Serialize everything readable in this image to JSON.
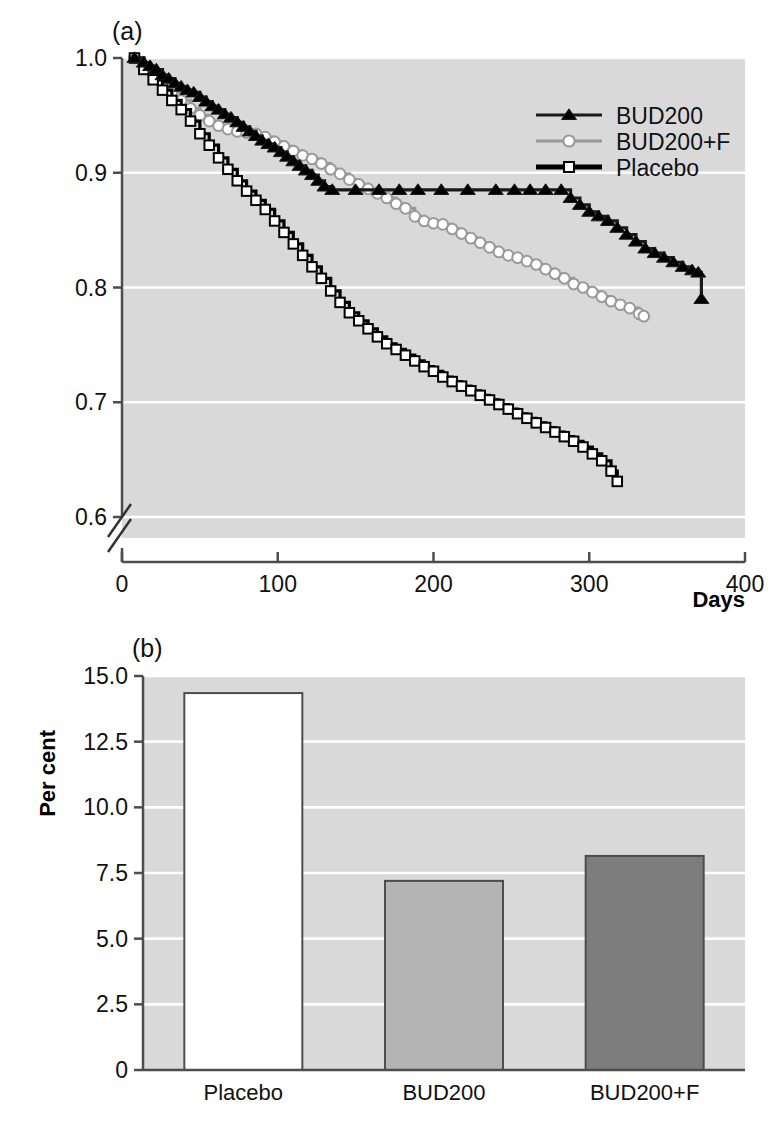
{
  "figure": {
    "panel_a_label": "(a)",
    "panel_b_label": "(b)"
  },
  "chart_data": [
    {
      "type": "line",
      "panel": "(a)",
      "title": "",
      "xlabel": "Days",
      "ylabel": "",
      "xlim": [
        0,
        400
      ],
      "ylim": [
        0.6,
        1.0
      ],
      "xticks": [
        0,
        100,
        200,
        300,
        400
      ],
      "xtick_labels": [
        "0",
        "100",
        "200",
        "300",
        "400"
      ],
      "yticks": [
        0.6,
        0.7,
        0.8,
        0.9,
        1.0
      ],
      "ytick_labels": [
        "0.6",
        "0.7",
        "0.8",
        "0.9",
        "1.0"
      ],
      "grid": true,
      "grid_color": "#ffffff",
      "plot_background": "#d9d9d9",
      "y_axis_break": true,
      "legend_position": "top-right",
      "series": [
        {
          "name": "BUD200",
          "color": "#1a1a1a",
          "marker": "triangle",
          "marker_color": "#000000",
          "x": [
            8,
            14,
            18,
            22,
            26,
            30,
            34,
            38,
            42,
            46,
            50,
            54,
            58,
            62,
            66,
            70,
            74,
            78,
            82,
            86,
            90,
            94,
            98,
            102,
            106,
            110,
            114,
            118,
            122,
            126,
            130,
            135,
            150,
            165,
            178,
            190,
            205,
            222,
            240,
            252,
            262,
            272,
            282,
            288,
            294,
            300,
            306,
            312,
            318,
            324,
            330,
            336,
            342,
            348,
            354,
            360,
            366,
            370,
            372
          ],
          "y": [
            1.0,
            0.996,
            0.993,
            0.99,
            0.985,
            0.982,
            0.978,
            0.975,
            0.972,
            0.97,
            0.966,
            0.962,
            0.958,
            0.955,
            0.951,
            0.948,
            0.944,
            0.94,
            0.936,
            0.932,
            0.928,
            0.925,
            0.922,
            0.918,
            0.914,
            0.91,
            0.906,
            0.902,
            0.898,
            0.893,
            0.888,
            0.885,
            0.885,
            0.885,
            0.885,
            0.885,
            0.885,
            0.885,
            0.885,
            0.885,
            0.885,
            0.885,
            0.885,
            0.878,
            0.872,
            0.866,
            0.862,
            0.858,
            0.852,
            0.846,
            0.84,
            0.834,
            0.83,
            0.826,
            0.822,
            0.818,
            0.815,
            0.813,
            0.79
          ]
        },
        {
          "name": "BUD200+F",
          "color": "#9a9a9a",
          "marker": "circle",
          "marker_color": "#ffffff",
          "x": [
            8,
            14,
            20,
            26,
            32,
            38,
            44,
            50,
            56,
            62,
            68,
            74,
            80,
            86,
            92,
            98,
            104,
            110,
            116,
            122,
            128,
            134,
            140,
            146,
            152,
            158,
            164,
            170,
            176,
            182,
            188,
            194,
            200,
            206,
            212,
            218,
            224,
            230,
            236,
            242,
            248,
            254,
            260,
            266,
            272,
            278,
            284,
            290,
            296,
            302,
            308,
            314,
            320,
            326,
            332,
            335
          ],
          "y": [
            1.0,
            0.993,
            0.986,
            0.978,
            0.97,
            0.963,
            0.956,
            0.95,
            0.945,
            0.941,
            0.938,
            0.936,
            0.935,
            0.934,
            0.931,
            0.927,
            0.923,
            0.919,
            0.915,
            0.912,
            0.908,
            0.903,
            0.899,
            0.894,
            0.89,
            0.886,
            0.882,
            0.878,
            0.873,
            0.869,
            0.862,
            0.858,
            0.856,
            0.855,
            0.851,
            0.847,
            0.843,
            0.839,
            0.835,
            0.831,
            0.828,
            0.826,
            0.823,
            0.82,
            0.816,
            0.812,
            0.808,
            0.803,
            0.8,
            0.796,
            0.792,
            0.788,
            0.785,
            0.782,
            0.777,
            0.775
          ]
        },
        {
          "name": "Placebo",
          "color": "#000000",
          "marker": "square",
          "marker_color": "#ffffff",
          "x": [
            8,
            14,
            20,
            26,
            32,
            38,
            44,
            50,
            56,
            62,
            68,
            74,
            80,
            86,
            92,
            98,
            104,
            110,
            116,
            122,
            128,
            134,
            140,
            146,
            152,
            158,
            164,
            170,
            176,
            182,
            188,
            194,
            200,
            206,
            212,
            218,
            224,
            230,
            236,
            242,
            248,
            254,
            260,
            266,
            272,
            278,
            284,
            290,
            296,
            302,
            308,
            314,
            318
          ],
          "y": [
            1.0,
            0.99,
            0.981,
            0.972,
            0.963,
            0.955,
            0.945,
            0.934,
            0.924,
            0.913,
            0.903,
            0.893,
            0.884,
            0.876,
            0.868,
            0.858,
            0.848,
            0.838,
            0.828,
            0.818,
            0.808,
            0.797,
            0.787,
            0.778,
            0.771,
            0.764,
            0.757,
            0.751,
            0.746,
            0.741,
            0.736,
            0.731,
            0.727,
            0.722,
            0.718,
            0.714,
            0.71,
            0.706,
            0.702,
            0.698,
            0.694,
            0.69,
            0.686,
            0.682,
            0.678,
            0.674,
            0.67,
            0.666,
            0.661,
            0.655,
            0.649,
            0.64,
            0.631
          ]
        }
      ]
    },
    {
      "type": "bar",
      "panel": "(b)",
      "title": "",
      "xlabel": "",
      "ylabel": "Per cent",
      "categories": [
        "Placebo",
        "BUD200",
        "BUD200+F"
      ],
      "values": [
        14.35,
        7.2,
        8.15
      ],
      "bar_colors": [
        "#ffffff",
        "#b4b4b4",
        "#7d7d7d"
      ],
      "bar_edge_color": "#4d4d4d",
      "ylim": [
        0,
        15
      ],
      "yticks": [
        0,
        2.5,
        5.0,
        7.5,
        10.0,
        12.5,
        15.0
      ],
      "ytick_labels": [
        "0",
        "2.5",
        "5.0",
        "7.5",
        "10.0",
        "12.5",
        "15.0"
      ],
      "grid": true,
      "grid_color": "#ffffff",
      "plot_background": "#d9d9d9"
    }
  ]
}
